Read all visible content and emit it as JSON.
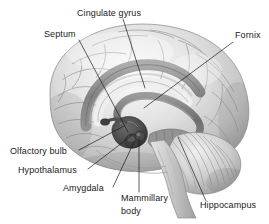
{
  "figure": {
    "width": 269,
    "height": 224,
    "background_color": "#ffffff",
    "illustration_style": "grayscale pencil/airbrush medical illustration",
    "label_color": "#1a1a1a",
    "leader_line_color": "#1a1a1a",
    "label_font_size_px": 9
  },
  "labels": [
    {
      "id": "cingulate-gyrus",
      "text": "Cingulate gyrus",
      "x": 77,
      "y": 16,
      "anchor": "start",
      "leader": {
        "x1": 123,
        "y1": 19,
        "x2": 145,
        "y2": 88
      }
    },
    {
      "id": "septum",
      "text": "Septum",
      "x": 44,
      "y": 37,
      "anchor": "start",
      "leader": {
        "x1": 79,
        "y1": 40,
        "x2": 128,
        "y2": 132
      }
    },
    {
      "id": "fornix",
      "text": "Fornix",
      "x": 235,
      "y": 38,
      "anchor": "start",
      "leader": {
        "x1": 233,
        "y1": 42,
        "x2": 144,
        "y2": 108
      }
    },
    {
      "id": "olfactory-bulb",
      "text": "Olfactory bulb",
      "x": 10,
      "y": 154,
      "anchor": "start",
      "leader": {
        "x1": 79,
        "y1": 150,
        "x2": 124,
        "y2": 126
      }
    },
    {
      "id": "hypothalamus",
      "text": "Hypothalamus",
      "x": 18,
      "y": 173,
      "anchor": "start",
      "leader": {
        "x1": 88,
        "y1": 169,
        "x2": 131,
        "y2": 136
      }
    },
    {
      "id": "amygdala",
      "text": "Amygdala",
      "x": 63,
      "y": 191,
      "anchor": "start",
      "leader": {
        "x1": 113,
        "y1": 187,
        "x2": 134,
        "y2": 142
      }
    },
    {
      "id": "mammillary-body",
      "text": "Mammillary",
      "text_line2": "body",
      "x": 121,
      "y": 201,
      "y2": 214,
      "anchor": "start",
      "leader": {
        "x1": 139,
        "y1": 192,
        "x2": 139,
        "y2": 139
      }
    },
    {
      "id": "hippocampus",
      "text": "Hippocampus",
      "x": 200,
      "y": 208,
      "anchor": "start",
      "leader": {
        "x1": 206,
        "y1": 201,
        "x2": 178,
        "y2": 137
      }
    }
  ],
  "structures": [
    {
      "id": "cerebral-cortex",
      "name": "cerebral cortex"
    },
    {
      "id": "cingulate-gyrus-band",
      "name": "cingulate gyrus band"
    },
    {
      "id": "fornix-arch",
      "name": "fornix arch"
    },
    {
      "id": "hippocampus-body",
      "name": "hippocampus"
    },
    {
      "id": "amygdala-body",
      "name": "amygdala"
    },
    {
      "id": "mammillary-body-structure",
      "name": "mammillary body"
    },
    {
      "id": "hypothalamus-region",
      "name": "hypothalamus"
    },
    {
      "id": "olfactory-bulb-structure",
      "name": "olfactory bulb"
    },
    {
      "id": "cerebellum",
      "name": "cerebellum"
    },
    {
      "id": "brainstem",
      "name": "brainstem"
    }
  ]
}
